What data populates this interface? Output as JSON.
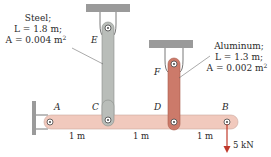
{
  "steel": {
    "material": "Steel;",
    "length": "L = 1.8 m;",
    "area_prefix": "A = 0.004 m",
    "area_exp": "2",
    "point": "E",
    "color": "#b9bdb9"
  },
  "aluminum": {
    "material": "Aluminum;",
    "length": "L = 1.3 m;",
    "area_prefix": "A = 0.002 m",
    "area_exp": "2",
    "point": "F",
    "color": "#cc7a6a"
  },
  "bar": {
    "color": "#f1c9bd",
    "points": {
      "A": "A",
      "C": "C",
      "D": "D",
      "B": "B"
    },
    "spans": [
      "1 m",
      "1 m",
      "1 m"
    ]
  },
  "load": {
    "label": "5 kN",
    "color": "#c0392b"
  },
  "support_color": "#9a9a9a"
}
